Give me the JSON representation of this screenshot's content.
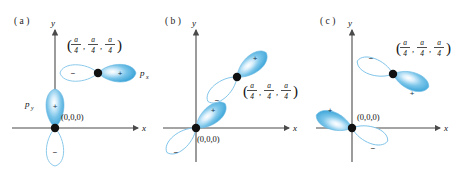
{
  "figure": {
    "background_color": "#ffffff",
    "lobe_positive_color": "#4aaede",
    "lobe_negative_color": "#ffffff",
    "lobe_outline_color": "#7ec3e8",
    "axis_color": "#4a4a4a",
    "atom_dot_color": "#111111",
    "panels": [
      {
        "id": "a",
        "label": "( a )",
        "axis_x_label": "x",
        "axis_y_label": "y",
        "origin_label": "(0,0,0)",
        "corner_label": {
          "open_paren": "(",
          "close_paren": ")",
          "numerator": "a",
          "denominator": "4",
          "comma": ",",
          "components": 3,
          "text": "(a/4, a/4, a/4)"
        },
        "orbitals": [
          {
            "name": "p_y",
            "display_name": "p",
            "subscript": "y",
            "at": "origin",
            "orientation": "vertical",
            "positive_lobe": "+",
            "positive_lobe_direction": "up",
            "negative_lobe": "−",
            "negative_lobe_direction": "down"
          },
          {
            "name": "p_x",
            "display_name": "p",
            "subscript": "x",
            "at": "corner",
            "orientation": "horizontal",
            "positive_lobe": "+",
            "positive_lobe_direction": "right",
            "negative_lobe": "−",
            "negative_lobe_direction": "left"
          }
        ]
      },
      {
        "id": "b",
        "label": "( b )",
        "axis_x_label": "x",
        "axis_y_label": "y",
        "origin_label": "(0,0,0)",
        "corner_label": {
          "open_paren": "(",
          "close_paren": ")",
          "numerator": "a",
          "denominator": "4",
          "comma": ",",
          "components": 3,
          "text": "(a/4, a/4, a/4)"
        },
        "orbitals": [
          {
            "name": "origin-orbital",
            "display_name": "",
            "subscript": "",
            "at": "origin",
            "orientation": "diagonal-up-right",
            "positive_lobe": "+",
            "positive_lobe_direction": "upper-right",
            "negative_lobe": "−",
            "negative_lobe_direction": "lower-left"
          },
          {
            "name": "corner-orbital",
            "display_name": "",
            "subscript": "",
            "at": "corner",
            "orientation": "diagonal-up-right",
            "positive_lobe": "+",
            "positive_lobe_direction": "upper-right",
            "negative_lobe": "−",
            "negative_lobe_direction": "lower-left"
          }
        ]
      },
      {
        "id": "c",
        "label": "( c )",
        "axis_x_label": "x",
        "axis_y_label": "y",
        "origin_label": "(0,0,0)",
        "corner_label": {
          "open_paren": "(",
          "close_paren": ")",
          "numerator": "a",
          "denominator": "4",
          "comma": ",",
          "components": 3,
          "text": "(a/4, a/4, a/4)"
        },
        "orbitals": [
          {
            "name": "origin-orbital",
            "display_name": "",
            "subscript": "",
            "at": "origin",
            "orientation": "diagonal-up-left",
            "positive_lobe": "+",
            "positive_lobe_direction": "upper-left",
            "negative_lobe": "−",
            "negative_lobe_direction": "lower-right"
          },
          {
            "name": "corner-orbital",
            "display_name": "",
            "subscript": "",
            "at": "corner",
            "orientation": "diagonal-up-left",
            "positive_lobe": "+",
            "positive_lobe_direction": "lower-right",
            "negative_lobe": "−",
            "negative_lobe_direction": "upper-left"
          }
        ]
      }
    ]
  }
}
